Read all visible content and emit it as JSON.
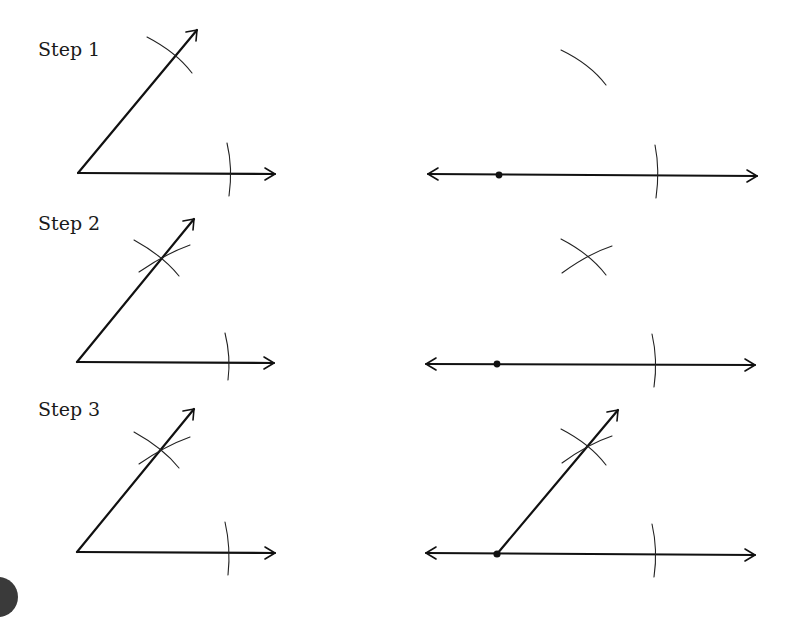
{
  "figure": {
    "steps": [
      {
        "label": "Step 1",
        "description": "Arc across both rays of the given angle; same-radius arc drawn from the point on the new line"
      },
      {
        "label": "Step 2",
        "description": "Arcs intersect on the given angle's ray and above the new line"
      },
      {
        "label": "Step 3",
        "description": "Ray drawn from the point on the new line through the arc intersection"
      }
    ]
  },
  "colors": {
    "ink": "#111111",
    "background": "#ffffff"
  }
}
